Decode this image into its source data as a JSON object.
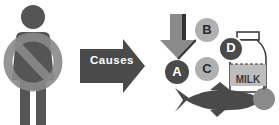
{
  "diagram": {
    "person": {
      "icon": "person-prohibited-icon",
      "color": "#555555",
      "prohibit_color": "#8a8a8a"
    },
    "arrow": {
      "label": "Causes",
      "color": "#4a4a4a"
    },
    "nutrients": {
      "down_arrow_icon": "decrease-arrow-icon",
      "circles": [
        {
          "letter": "A",
          "style": "dark"
        },
        {
          "letter": "B",
          "style": "light"
        },
        {
          "letter": "C",
          "style": "light"
        },
        {
          "letter": "D",
          "style": "dark"
        }
      ]
    },
    "foods": {
      "milk_label": "MILK",
      "items": [
        "milk-bottle-icon",
        "fish-icon",
        "apple-icon"
      ]
    },
    "colors": {
      "dark": "#4a4a4a",
      "light": "#b0b0b0",
      "medium": "#8a8a8a"
    }
  }
}
